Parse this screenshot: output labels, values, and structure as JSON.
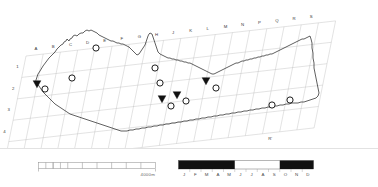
{
  "figure": {
    "type": "map"
  },
  "map": {
    "grid": {
      "column_labels_top": [
        "A",
        "B",
        "C",
        "D",
        "E",
        "F",
        "G",
        "H",
        "J",
        "K",
        "L",
        "M",
        "N",
        "P",
        "Q",
        "R",
        "S"
      ],
      "row_labels_left": [
        "1",
        "2",
        "3",
        "4"
      ],
      "labels_bottom": [
        "B'",
        "D'",
        "F'",
        "R'"
      ],
      "note_excluded_letter": "I"
    },
    "markers": {
      "circle_label": "circle-marker",
      "triangle_label": "triangle-marker",
      "circle_count": 12,
      "triangle_count": 4,
      "circles": [
        {
          "x": 96,
          "y": 48
        },
        {
          "x": 72,
          "y": 78
        },
        {
          "x": 45,
          "y": 89
        },
        {
          "x": 155,
          "y": 68
        },
        {
          "x": 160,
          "y": 83
        },
        {
          "x": 171,
          "y": 106
        },
        {
          "x": 186,
          "y": 101
        },
        {
          "x": 216,
          "y": 88
        },
        {
          "x": 272,
          "y": 105
        },
        {
          "x": 290,
          "y": 100
        }
      ],
      "triangles": [
        {
          "x": 37,
          "y": 84
        },
        {
          "x": 162,
          "y": 99
        },
        {
          "x": 177,
          "y": 95
        },
        {
          "x": 206,
          "y": 81
        }
      ]
    },
    "outline_name": "coastline-outline"
  },
  "scale_bar": {
    "name": "distance-scale-bar",
    "caption": "4000m",
    "major_divisions": 8,
    "subdivided_segments": 3
  },
  "month_bar": {
    "name": "seasonal-month-bar",
    "months": [
      "J",
      "F",
      "M",
      "A",
      "M",
      "J",
      "J",
      "A",
      "S",
      "O",
      "N",
      "D"
    ],
    "filled_ranges": [
      {
        "start_index": 0,
        "end_index": 4
      },
      {
        "start_index": 9,
        "end_index": 11
      }
    ],
    "fill_color": "#111111",
    "empty_color": "#ffffff"
  },
  "colors": {
    "ink": "#1a1a1a",
    "grid": "#b8b8b8",
    "label": "#3a3a3a",
    "marker_stroke": "#111111",
    "background": "#ffffff"
  }
}
